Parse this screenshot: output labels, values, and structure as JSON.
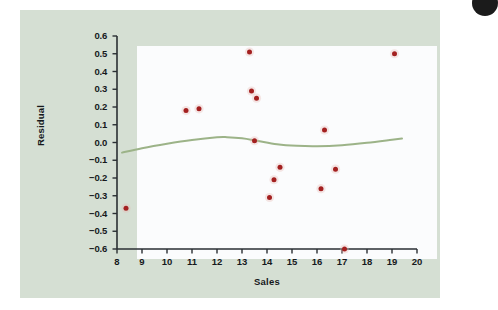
{
  "chart_data": {
    "type": "scatter",
    "title": "",
    "subtitle": "",
    "xlabel": "Sales",
    "ylabel": "Residual",
    "xlim": [
      8,
      20
    ],
    "ylim": [
      -0.6,
      0.6
    ],
    "xticks": [
      8,
      9,
      10,
      11,
      12,
      13,
      14,
      15,
      16,
      17,
      18,
      19,
      20
    ],
    "xtick_labels": [
      "8",
      "9",
      "10",
      "11",
      "12",
      "13",
      "14",
      "15",
      "16",
      "17",
      "18",
      "19",
      "20"
    ],
    "yticks": [
      0.6,
      0.5,
      0.4,
      0.3,
      0.2,
      0.1,
      0.0,
      -0.1,
      -0.2,
      -0.3,
      -0.4,
      -0.5,
      -0.6
    ],
    "ytick_labels": [
      "0.6",
      "0.5",
      "0.4",
      "0.3",
      "0.2",
      "0.1",
      "0.0",
      "−0.1",
      "−0.2",
      "−0.3",
      "−0.4",
      "−0.5",
      "−0.6"
    ],
    "grid": false,
    "legend": null,
    "series": [
      {
        "name": "Residuals",
        "type": "scatter",
        "color": "#a32020",
        "marker": "circle",
        "points": [
          {
            "x": 8.36,
            "y": -0.37
          },
          {
            "x": 10.76,
            "y": 0.18
          },
          {
            "x": 11.28,
            "y": 0.19
          },
          {
            "x": 13.3,
            "y": 0.51
          },
          {
            "x": 13.38,
            "y": 0.29
          },
          {
            "x": 13.58,
            "y": 0.25
          },
          {
            "x": 13.5,
            "y": 0.01
          },
          {
            "x": 14.1,
            "y": -0.31
          },
          {
            "x": 14.28,
            "y": -0.21
          },
          {
            "x": 14.52,
            "y": -0.14
          },
          {
            "x": 16.16,
            "y": -0.26
          },
          {
            "x": 16.3,
            "y": 0.07
          },
          {
            "x": 16.74,
            "y": -0.15
          },
          {
            "x": 17.1,
            "y": -0.6
          },
          {
            "x": 19.1,
            "y": 0.5
          }
        ]
      },
      {
        "name": "Smoother",
        "type": "line",
        "color": "#9cb388",
        "points": [
          {
            "x": 8.2,
            "y": -0.057
          },
          {
            "x": 9.0,
            "y": -0.032
          },
          {
            "x": 10.0,
            "y": -0.007
          },
          {
            "x": 11.0,
            "y": 0.014
          },
          {
            "x": 12.0,
            "y": 0.029
          },
          {
            "x": 12.4,
            "y": 0.03
          },
          {
            "x": 13.0,
            "y": 0.024
          },
          {
            "x": 13.6,
            "y": 0.01
          },
          {
            "x": 14.4,
            "y": -0.01
          },
          {
            "x": 15.2,
            "y": -0.019
          },
          {
            "x": 16.0,
            "y": -0.021
          },
          {
            "x": 17.0,
            "y": -0.015
          },
          {
            "x": 18.0,
            "y": -0.002
          },
          {
            "x": 19.0,
            "y": 0.015
          },
          {
            "x": 19.4,
            "y": 0.022
          }
        ]
      }
    ],
    "colors": {
      "panel_background": "#d5dfd3",
      "plot_background": "#fbfcfd",
      "axis": "#2a2f33",
      "point": "#a32020",
      "smoother": "#9cb388",
      "text": "#16191c"
    }
  }
}
